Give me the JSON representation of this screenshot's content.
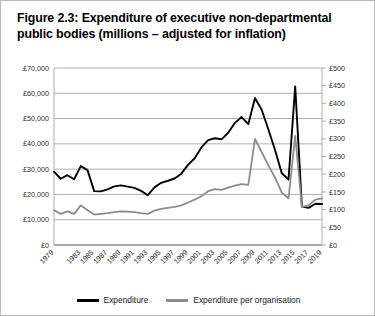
{
  "figure": {
    "title": "Figure 2.3: Expenditure of executive non-departmental public bodies (millions – adjusted for inflation)"
  },
  "legend": {
    "items": [
      {
        "label": "Expenditure",
        "color": "#000000",
        "name": "legend-expenditure"
      },
      {
        "label": "Expenditure per organisation",
        "color": "#8c8c8c",
        "name": "legend-expenditure-per-organisation"
      }
    ]
  },
  "chart_data": {
    "type": "line",
    "title": "Figure 2.3: Expenditure of executive non-departmental public bodies (millions – adjusted for inflation)",
    "xlabel": "",
    "grid": true,
    "legend_position": "bottom",
    "x": [
      1979,
      1980,
      1981,
      1982,
      1983,
      1984,
      1985,
      1986,
      1987,
      1988,
      1989,
      1990,
      1991,
      1992,
      1993,
      1994,
      1995,
      1996,
      1997,
      1998,
      1999,
      2000,
      2001,
      2002,
      2003,
      2004,
      2005,
      2006,
      2007,
      2008,
      2009,
      2010,
      2011,
      2012,
      2013,
      2014,
      2015,
      2016,
      2017,
      2018,
      2019
    ],
    "xtick_labels": [
      "1979",
      "1983",
      "1985",
      "1987",
      "1989",
      "1991",
      "1993",
      "1995",
      "1997",
      "1999",
      "2001",
      "2003",
      "2005",
      "2007",
      "2009",
      "2011",
      "2013",
      "2015",
      "2017",
      "2019"
    ],
    "xtick_values": [
      1979,
      1983,
      1985,
      1987,
      1989,
      1991,
      1993,
      1995,
      1997,
      1999,
      2001,
      2003,
      2005,
      2007,
      2009,
      2011,
      2013,
      2015,
      2017,
      2019
    ],
    "axes": [
      {
        "side": "left",
        "ylabel": "",
        "ylim": [
          0,
          70000
        ],
        "ytick_values": [
          0,
          10000,
          20000,
          30000,
          40000,
          50000,
          60000,
          70000
        ],
        "ytick_labels": [
          "£0",
          "£10,000",
          "£20,000",
          "£30,000",
          "£40,000",
          "£50,000",
          "£60,000",
          "£70,000"
        ]
      },
      {
        "side": "right",
        "ylabel": "",
        "ylim": [
          0,
          500
        ],
        "ytick_values": [
          0,
          50,
          100,
          150,
          200,
          250,
          300,
          350,
          400,
          450,
          500
        ],
        "ytick_labels": [
          "£0",
          "£50",
          "£100",
          "£150",
          "£200",
          "£250",
          "£300",
          "£350",
          "£400",
          "£450",
          "£500"
        ]
      }
    ],
    "series": [
      {
        "name": "Expenditure",
        "color": "#000000",
        "axis": "left",
        "values": [
          29000,
          26200,
          27600,
          26000,
          31200,
          29600,
          21300,
          21200,
          22000,
          23200,
          23600,
          23100,
          22600,
          21400,
          19700,
          22800,
          24600,
          25400,
          26300,
          28200,
          31700,
          34300,
          38600,
          41500,
          42200,
          41800,
          44400,
          48300,
          50600,
          47800,
          58100,
          53500,
          45700,
          37500,
          28400,
          25900,
          62700,
          15200,
          14700,
          16300,
          16200
        ]
      },
      {
        "name": "Expenditure per organisation",
        "color": "#8c8c8c",
        "axis": "right",
        "values": [
          98,
          88,
          95,
          88,
          112,
          98,
          86,
          88,
          90,
          93,
          95,
          94,
          93,
          90,
          88,
          97,
          102,
          105,
          108,
          112,
          120,
          128,
          138,
          152,
          158,
          156,
          162,
          168,
          172,
          170,
          300,
          262,
          225,
          190,
          148,
          132,
          308,
          108,
          112,
          128,
          132
        ]
      }
    ]
  }
}
